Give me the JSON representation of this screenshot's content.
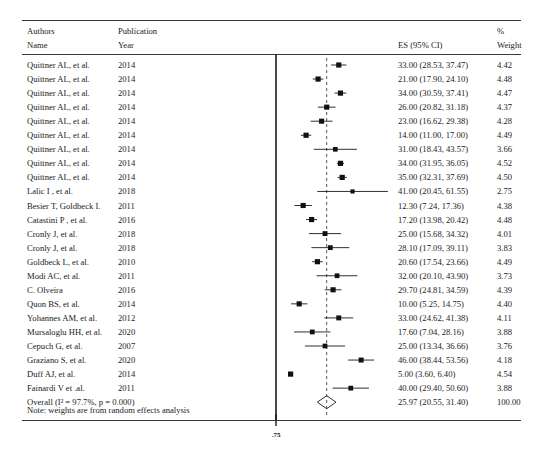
{
  "headers": {
    "authors": "Authors",
    "name": "Name",
    "publication": "Publication",
    "year": "Year",
    "es": "ES (95% CI)",
    "percent": "%",
    "weight": "Weight"
  },
  "note": "Note: weights are from random effects analysis",
  "axis": {
    "tick_label": ".75",
    "tick_value": 0
  },
  "chart_data": {
    "type": "forest",
    "title": "",
    "xlabel": "",
    "ylabel": "",
    "effect_measure": "ES (95% CI)",
    "pooled_estimate": 25.97,
    "pooled_ci_low": 20.55,
    "pooled_ci_high": 31.4,
    "heterogeneity_i2": "97.7%",
    "heterogeneity_p": "0.000",
    "total_weight": "100.00",
    "axis_tick_labels": [
      ".75"
    ],
    "x_axis_origin": 0,
    "rows": [
      {
        "author": "Quittner AL, et al.",
        "year": "2014",
        "es": 33.0,
        "lo": 28.53,
        "hi": 37.47,
        "es_text": "33.00 (28.53, 37.47)",
        "weight": "4.42"
      },
      {
        "author": "Quittner AL, et al.",
        "year": "2014",
        "es": 21.0,
        "lo": 17.9,
        "hi": 24.1,
        "es_text": "21.00 (17.90, 24.10)",
        "weight": "4.48"
      },
      {
        "author": "Quittner AL, et al.",
        "year": "2014",
        "es": 34.0,
        "lo": 30.59,
        "hi": 37.41,
        "es_text": "34.00 (30.59, 37.41)",
        "weight": "4.47"
      },
      {
        "author": "Quittner AL, et al.",
        "year": "2014",
        "es": 26.0,
        "lo": 20.82,
        "hi": 31.18,
        "es_text": "26.00 (20.82, 31.18)",
        "weight": "4.37"
      },
      {
        "author": "Quittner AL, et al.",
        "year": "2014",
        "es": 23.0,
        "lo": 16.62,
        "hi": 29.38,
        "es_text": "23.00 (16.62, 29.38)",
        "weight": "4.28"
      },
      {
        "author": "Quittner AL, et al.",
        "year": "2014",
        "es": 14.0,
        "lo": 11.0,
        "hi": 17.0,
        "es_text": "14.00 (11.00, 17.00)",
        "weight": "4.49"
      },
      {
        "author": "Quittner AL, et al.",
        "year": "2014",
        "es": 31.0,
        "lo": 18.43,
        "hi": 43.57,
        "es_text": "31.00 (18.43, 43.57)",
        "weight": "3.66"
      },
      {
        "author": "Quittner AL, et al.",
        "year": "2014",
        "es": 34.0,
        "lo": 31.95,
        "hi": 36.05,
        "es_text": "34.00 (31.95, 36.05)",
        "weight": "4.52"
      },
      {
        "author": "Quittner AL, et al.",
        "year": "2014",
        "es": 35.0,
        "lo": 32.31,
        "hi": 37.69,
        "es_text": "35.00 (32.31, 37.69)",
        "weight": "4.50"
      },
      {
        "author": "Lalic I , et al.",
        "year": "2018",
        "es": 41.0,
        "lo": 20.45,
        "hi": 61.55,
        "es_text": "41.00 (20.45, 61.55)",
        "weight": "2.75"
      },
      {
        "author": "Besier T, Goldbeck I.",
        "year": "2011",
        "es": 12.3,
        "lo": 7.24,
        "hi": 17.36,
        "es_text": "12.30 (7.24, 17.36)",
        "weight": "4.38"
      },
      {
        "author": "Catastini P , et al.",
        "year": "2016",
        "es": 17.2,
        "lo": 13.98,
        "hi": 20.42,
        "es_text": "17.20 (13.98, 20.42)",
        "weight": "4.48"
      },
      {
        "author": "Cronly J, et al.",
        "year": "2018",
        "es": 25.0,
        "lo": 15.68,
        "hi": 34.32,
        "es_text": "25.00 (15.68, 34.32)",
        "weight": "4.01"
      },
      {
        "author": "Cronly J, et al.",
        "year": "2018",
        "es": 28.1,
        "lo": 17.09,
        "hi": 39.11,
        "es_text": "28.10 (17.09, 39.11)",
        "weight": "3.83"
      },
      {
        "author": "Goldbeck L, et al.",
        "year": "2010",
        "es": 20.6,
        "lo": 17.54,
        "hi": 23.66,
        "es_text": "20.60 (17.54, 23.66)",
        "weight": "4.49"
      },
      {
        "author": "Modi AC, et al.",
        "year": "2011",
        "es": 32.0,
        "lo": 20.1,
        "hi": 43.9,
        "es_text": "32.00 (20.10, 43.90)",
        "weight": "3.73"
      },
      {
        "author": "C. Olveira",
        "year": "2016",
        "es": 29.7,
        "lo": 24.81,
        "hi": 34.59,
        "es_text": "29.70 (24.81, 34.59)",
        "weight": "4.39"
      },
      {
        "author": "Quon BS, et al.",
        "year": "2014",
        "es": 10.0,
        "lo": 5.25,
        "hi": 14.75,
        "es_text": "10.00 (5.25, 14.75)",
        "weight": "4.40"
      },
      {
        "author": "Yohannes AM, et al.",
        "year": "2012",
        "es": 33.0,
        "lo": 24.62,
        "hi": 41.38,
        "es_text": "33.00 (24.62, 41.38)",
        "weight": "4.11"
      },
      {
        "author": "Mursaloglu HH, et al.",
        "year": "2020",
        "es": 17.6,
        "lo": 7.04,
        "hi": 28.16,
        "es_text": "17.60 (7.04, 28.16)",
        "weight": "3.88"
      },
      {
        "author": "Cepuch G, et al.",
        "year": "2007",
        "es": 25.0,
        "lo": 13.34,
        "hi": 36.66,
        "es_text": "25.00 (13.34, 36.66)",
        "weight": "3.76"
      },
      {
        "author": "Graziano S, et al.",
        "year": "2020",
        "es": 46.0,
        "lo": 38.44,
        "hi": 53.56,
        "es_text": "46.00 (38.44, 53.56)",
        "weight": "4.18"
      },
      {
        "author": "Duff AJ, et al.",
        "year": "2014",
        "es": 5.0,
        "lo": 3.6,
        "hi": 6.4,
        "es_text": "5.00 (3.60, 6.40)",
        "weight": "4.54"
      },
      {
        "author": "Fainardi V et .al.",
        "year": "2011",
        "es": 40.0,
        "lo": 29.4,
        "hi": 50.6,
        "es_text": "40.00 (29.40, 50.60)",
        "weight": "3.88"
      }
    ],
    "overall": {
      "author": "Overall (I² = 97.7%, p = 0.000)",
      "year": "",
      "es": 25.97,
      "lo": 20.55,
      "hi": 31.4,
      "es_text": "25.97 (20.55, 31.40)",
      "weight": "100.00"
    }
  }
}
